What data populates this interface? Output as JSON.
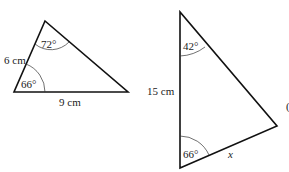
{
  "triangle_1": {
    "side_left": "6 cm",
    "side_bottom": "9 cm",
    "angle_top": "72°",
    "angle_bottom_left": "66°"
  },
  "triangle_2": {
    "side_left": "15 cm",
    "side_bottom_right": "x",
    "angle_top": "42°",
    "angle_bottom": "66°",
    "edge_label_partial": "("
  }
}
